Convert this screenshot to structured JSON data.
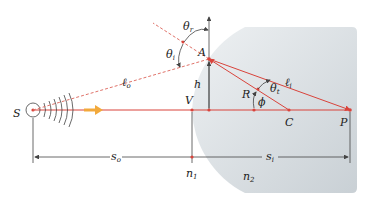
{
  "colors": {
    "ray": "#d9433b",
    "dashed_ray": "#e0736a",
    "glass": "#d6dce0",
    "arrow": "#f2a93b",
    "line": "#444444"
  },
  "labels": {
    "source": "S",
    "vertex": "V",
    "point_a": "A",
    "height": "h",
    "radius": "R",
    "center": "C",
    "image_point": "P",
    "phi": "ϕ",
    "theta_r": "θ",
    "theta_r_sub": "r",
    "theta_i": "θ",
    "theta_i_sub": "i",
    "theta_t": "θ",
    "theta_t_sub": "t",
    "l_o": "ℓ",
    "l_o_sub": "o",
    "l_i": "ℓ",
    "l_i_sub": "i",
    "s_o": "s",
    "s_o_sub": "o",
    "s_i": "s",
    "s_i_sub": "i",
    "n1": "n",
    "n1_sub": "1",
    "n2": "n",
    "n2_sub": "2"
  }
}
